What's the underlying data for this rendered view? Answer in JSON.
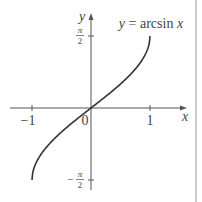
{
  "chart_data": {
    "type": "line",
    "title": "",
    "function_label": "y = arcsin x",
    "xlabel": "x",
    "ylabel": "y",
    "xlim": [
      -1.3,
      1.55
    ],
    "ylim": [
      -1.7,
      1.65
    ],
    "x_ticks": [
      {
        "value": -1,
        "label": "−1"
      },
      {
        "value": 0,
        "label": "0"
      },
      {
        "value": 1,
        "label": "1"
      }
    ],
    "y_ticks": [
      {
        "value": 1.5708,
        "label_num": "π",
        "label_den": "2",
        "sign": ""
      },
      {
        "value": -1.5708,
        "label_num": "π",
        "label_den": "2",
        "sign": "−"
      }
    ],
    "grid": false,
    "series": [
      {
        "name": "y = arcsin x",
        "x": [
          -1,
          -0.98,
          -0.95,
          -0.9,
          -0.8,
          -0.7,
          -0.6,
          -0.5,
          -0.4,
          -0.3,
          -0.2,
          -0.1,
          0,
          0.1,
          0.2,
          0.3,
          0.4,
          0.5,
          0.6,
          0.7,
          0.8,
          0.9,
          0.95,
          0.98,
          1
        ],
        "y": [
          -1.5708,
          -1.3705,
          -1.2532,
          -1.1198,
          -0.9273,
          -0.7754,
          -0.6435,
          -0.5236,
          -0.4115,
          -0.3047,
          -0.2014,
          -0.1002,
          0,
          0.1002,
          0.2014,
          0.3047,
          0.4115,
          0.5236,
          0.6435,
          0.7754,
          0.9273,
          1.1198,
          1.2532,
          1.3705,
          1.5708
        ]
      }
    ]
  },
  "colors": {
    "curve": "#333333",
    "axis": "#555555",
    "border": "#999999"
  }
}
